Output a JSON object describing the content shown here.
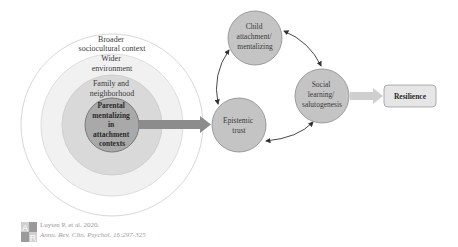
{
  "diagram": {
    "concentric": {
      "center": [
        112,
        125
      ],
      "rings": [
        {
          "id": "broader",
          "label_lines": [
            "Broader",
            "sociocultural context"
          ],
          "radius": 91,
          "fill": "#ffffff",
          "stroke": "#d8d8d8"
        },
        {
          "id": "wider",
          "label_lines": [
            "Wider",
            "environment"
          ],
          "radius": 71,
          "fill": "#f1f1f1",
          "stroke": "#dddddd"
        },
        {
          "id": "family",
          "label_lines": [
            "Family and",
            "neighborhood"
          ],
          "radius": 50,
          "fill": "#d9d9d9",
          "stroke": "#cfcfcf"
        },
        {
          "id": "parental",
          "label_lines": [
            "Parental",
            "mentalizing",
            "in",
            "attachment",
            "contexts"
          ],
          "radius": 27,
          "fill": "#a9a9a9",
          "stroke": "#7a7a7a"
        }
      ]
    },
    "nodes": [
      {
        "id": "child",
        "label_lines": [
          "Child",
          "attachment/",
          "mentalizing"
        ],
        "cx": 255,
        "cy": 38,
        "r": 27
      },
      {
        "id": "epistemic",
        "label_lines": [
          "Epistemic",
          "trust"
        ],
        "cx": 239,
        "cy": 125,
        "r": 27
      },
      {
        "id": "social",
        "label_lines": [
          "Social",
          "learning/",
          "salutogenesis"
        ],
        "cx": 322,
        "cy": 96,
        "r": 27
      }
    ],
    "outcome": {
      "label": "Resilience",
      "x": 384,
      "y": 85,
      "w": 52,
      "h": 22
    },
    "colors": {
      "node_fill": "#c4c4c4",
      "node_stroke": "#8a8a8a",
      "big_arrow": "#8c8c8c",
      "light_arrow": "#cfcfcf",
      "connector": "#333333",
      "outcome_fill": "#e6e6e6",
      "outcome_stroke": "#9a9a9a"
    }
  },
  "caption": {
    "line1": "Luyten P, et al. 2020.",
    "line2": "Annu. Rev. Clin. Psychol. 16:297-325",
    "logo": "AR"
  }
}
